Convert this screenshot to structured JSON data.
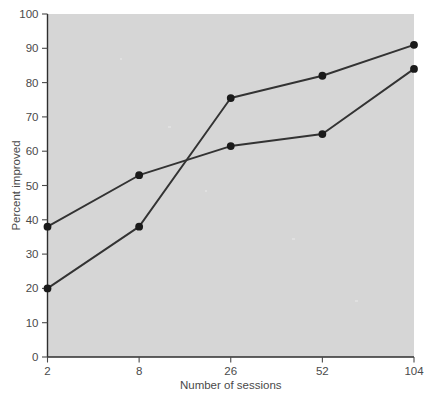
{
  "chart_data": {
    "type": "line",
    "title": "",
    "subtitle": "",
    "xlabel": "Number of sessions",
    "ylabel": "Percent improved",
    "categories": [
      "2",
      "8",
      "26",
      "52",
      "104"
    ],
    "x": [
      2,
      8,
      26,
      52,
      104
    ],
    "x_scale": "ordinal",
    "xlim": [
      0,
      4
    ],
    "ylim": [
      0,
      100
    ],
    "ytick_labels": [
      "0",
      "10",
      "20",
      "30",
      "40",
      "50",
      "60",
      "70",
      "80",
      "90",
      "100"
    ],
    "yticks": [
      0,
      10,
      20,
      30,
      40,
      50,
      60,
      70,
      80,
      90,
      100
    ],
    "xtick_labels": [
      "2",
      "8",
      "26",
      "52",
      "104"
    ],
    "grid": false,
    "legend": "none",
    "plot_background_color": "#d6d6d6",
    "line_color": "#333333",
    "marker_color": "#1a1a1a",
    "series": [
      {
        "name": "series-a",
        "values": [
          20,
          38,
          75.5,
          82,
          91
        ]
      },
      {
        "name": "series-b",
        "values": [
          38,
          53,
          61.5,
          65,
          84
        ]
      }
    ],
    "annotations": []
  }
}
